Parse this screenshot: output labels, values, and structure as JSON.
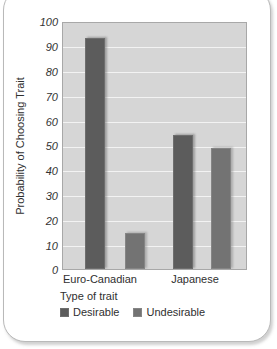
{
  "chart_data": {
    "type": "bar",
    "title": "",
    "xlabel": "Type of trait",
    "ylabel": "Probability of Choosing Trait",
    "categories": [
      "Euro-Canadian",
      "Japanese"
    ],
    "series": [
      {
        "name": "Desirable",
        "values": [
          94,
          54.5
        ],
        "color": "#5c5c5c"
      },
      {
        "name": "Undesirable",
        "values": [
          14.5,
          49
        ],
        "color": "#737373"
      }
    ],
    "ylim": [
      0,
      100
    ],
    "yticks": [
      0,
      10,
      20,
      30,
      40,
      50,
      60,
      70,
      80,
      90,
      100
    ],
    "ytick_labels": [
      "0",
      "10",
      "20",
      "30",
      "40",
      "50",
      "60",
      "70",
      "80",
      "90",
      "100"
    ],
    "grid": true,
    "legend_position": "below-axis",
    "plot_background": "#d6d6d6",
    "gridline_color": "#f3f3f3"
  },
  "legend": {
    "title": "Type of trait",
    "entries": [
      {
        "label": "Desirable",
        "swatch": "desirable-swatch"
      },
      {
        "label": "Undesirable",
        "swatch": "undesirable-swatch"
      }
    ]
  }
}
